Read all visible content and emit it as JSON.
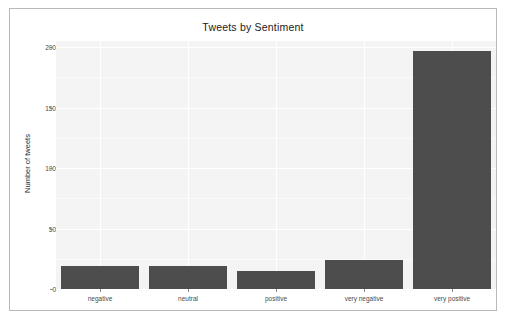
{
  "chart_data": {
    "type": "bar",
    "title": "Tweets by Sentiment",
    "xlabel": "",
    "ylabel": "Number of tweets",
    "categories": [
      "negative",
      "neutral",
      "positive",
      "very negative",
      "very positive"
    ],
    "values": [
      19,
      19,
      15,
      24,
      197
    ],
    "ylim": [
      0,
      205
    ],
    "yticks": [
      0,
      50,
      100,
      150,
      200
    ],
    "ytick_labels": [
      "0",
      "50",
      "100",
      "150",
      "200"
    ],
    "grid": true,
    "legend": false,
    "bar_color": "#4d4d4d",
    "panel_color": "#f4f4f4",
    "gridline_color": "#ffffff"
  },
  "figure": {
    "frame_border_color": "#b9b9b9",
    "background": "#ffffff"
  }
}
